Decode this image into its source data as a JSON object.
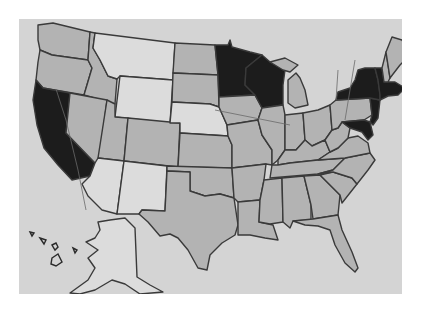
{
  "map": {
    "type": "choropleth",
    "region": "United States",
    "color_scheme": "grayscale",
    "legend": [],
    "tiers": {
      "dark": {
        "color": "#1c1c1c",
        "states": [
          "California",
          "Minnesota",
          "Wisconsin",
          "New York",
          "Vermont",
          "Massachusetts",
          "Connecticut",
          "Rhode Island",
          "New Jersey",
          "Delaware",
          "Maryland"
        ]
      },
      "mid": {
        "color": "#b3b3b3",
        "states": [
          "Washington",
          "Oregon",
          "Idaho",
          "Nevada",
          "Utah",
          "Colorado",
          "North Dakota",
          "South Dakota",
          "Kansas",
          "Oklahoma",
          "Texas",
          "Iowa",
          "Missouri",
          "Arkansas",
          "Louisiana",
          "Illinois",
          "Indiana",
          "Michigan",
          "Ohio",
          "Kentucky",
          "Tennessee",
          "Mississippi",
          "Alabama",
          "Georgia",
          "Florida",
          "South Carolina",
          "North Carolina",
          "Virginia",
          "West Virginia",
          "Pennsylvania",
          "New Hampshire",
          "Maine"
        ]
      },
      "light": {
        "color": "#dcdcdc",
        "states": [
          "Montana",
          "Wyoming",
          "Nebraska",
          "Arizona",
          "New Mexico",
          "Alaska",
          "Hawaii"
        ]
      }
    },
    "background_color": "#d4d4d4"
  }
}
